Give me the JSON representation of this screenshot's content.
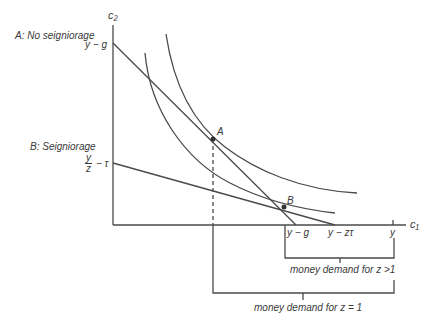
{
  "diagram": {
    "type": "indifference-curve / intertemporal budget constraint",
    "axes": {
      "x_label": "c₁",
      "y_label": "c₂"
    },
    "panel_labels": {
      "a": "A: No seigniorage",
      "b": "B: Seigniorage"
    },
    "y_intercepts": {
      "a": "y − g",
      "b_num": "y",
      "b_den": "z",
      "b_suffix": "− τ"
    },
    "x_ticks": {
      "a": "y − g",
      "b": "y − zτ",
      "y": "y"
    },
    "points": {
      "a": "A",
      "b": "B"
    },
    "brackets": {
      "z_gt_1": "money demand for z >1",
      "z_eq_1": "money demand for z = 1"
    },
    "colors": {
      "line": "#4a4a4a",
      "background": "#ffffff"
    }
  }
}
